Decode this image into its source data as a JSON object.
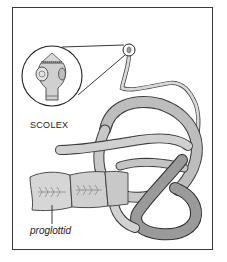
{
  "diagram": {
    "labels": {
      "scolex": "SCOLEX",
      "proglottid": "proglottid"
    },
    "colors": {
      "frame": "#3a3a3a",
      "outline": "#3c3c3c",
      "segment_light": "#d4d4d4",
      "segment_mid": "#b0b0b0",
      "segment_dark": "#7a7a7a",
      "background": "#ffffff"
    },
    "callouts": [
      {
        "name": "scolex-magnifier",
        "cx": 52,
        "cy": 76,
        "r": 30
      },
      {
        "name": "scolex-tip",
        "cx": 129,
        "cy": 50,
        "r": 6
      }
    ]
  }
}
